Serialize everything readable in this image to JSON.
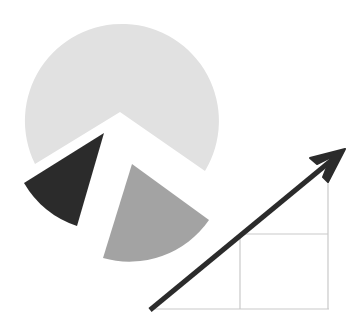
{
  "illustration": {
    "description": "Exploded pie chart next to an upward-trending arrow over a grid",
    "pie": {
      "slices": [
        {
          "name": "large-slice",
          "color": "#e1e1e1",
          "approx_share": 0.72
        },
        {
          "name": "dark-slice",
          "color": "#2b2b2b",
          "approx_share": 0.11
        },
        {
          "name": "medium-slice",
          "color": "#a3a3a3",
          "approx_share": 0.17
        }
      ]
    },
    "growth_arrow": {
      "color": "#2b2b2b",
      "direction": "up-right"
    },
    "grid": {
      "line_color": "#c9c9c9"
    }
  }
}
